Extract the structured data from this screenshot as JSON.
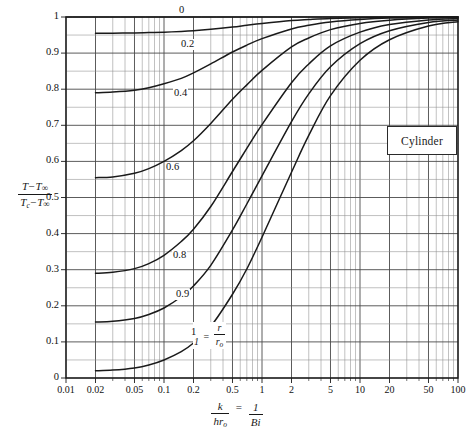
{
  "chart_data": {
    "type": "line",
    "title": "",
    "annotation_box": "Cylinder",
    "xlabel": "k/(hr_o) = 1/Bi",
    "ylabel": "(T - T∞)/(T_c - T∞)",
    "xscale": "log",
    "xlim": [
      0.01,
      100
    ],
    "ylim": [
      0,
      1
    ],
    "grid": true,
    "legend_position": "inline-curve-labels",
    "xticks": [
      "0.01",
      "0.02",
      "0.05",
      "0.1",
      "0.2",
      "0.5",
      "1",
      "2",
      "5",
      "10",
      "20",
      "50",
      "100"
    ],
    "xtick_values": [
      0.01,
      0.02,
      0.05,
      0.1,
      0.2,
      0.5,
      1,
      2,
      5,
      10,
      20,
      50,
      100
    ],
    "yticks": [
      "0",
      "0.1",
      "0.2",
      "0.3",
      "0.4",
      "0.5",
      "0.6",
      "0.7",
      "0.8",
      "0.9",
      "1"
    ],
    "ytick_values": [
      0,
      0.1,
      0.2,
      0.3,
      0.4,
      0.5,
      0.6,
      0.7,
      0.8,
      0.9,
      1
    ],
    "curve_parameter": "r/r_o",
    "series": [
      {
        "name": "0",
        "label": "0",
        "label_pos": {
          "x": 178,
          "y": 5
        },
        "x": [
          0.01,
          100
        ],
        "values": [
          1,
          1
        ]
      },
      {
        "name": "0.2",
        "label": "0.2",
        "label_pos": {
          "x": 180,
          "y": 39
        },
        "x": [
          0.02,
          0.03,
          0.05,
          0.07,
          0.1,
          0.15,
          0.2,
          0.3,
          0.5,
          0.7,
          1,
          2,
          3,
          5,
          10,
          20,
          50,
          100
        ],
        "values": [
          0.955,
          0.955,
          0.956,
          0.957,
          0.958,
          0.96,
          0.962,
          0.966,
          0.972,
          0.977,
          0.982,
          0.99,
          0.993,
          0.996,
          0.998,
          0.999,
          1.0,
          1.0
        ]
      },
      {
        "name": "0.4",
        "label": "0.4",
        "label_pos": {
          "x": 173,
          "y": 88
        },
        "x": [
          0.02,
          0.03,
          0.05,
          0.07,
          0.1,
          0.15,
          0.2,
          0.3,
          0.5,
          0.7,
          1,
          2,
          3,
          5,
          10,
          20,
          50,
          100
        ],
        "values": [
          0.79,
          0.792,
          0.797,
          0.804,
          0.815,
          0.83,
          0.845,
          0.87,
          0.903,
          0.922,
          0.94,
          0.967,
          0.977,
          0.986,
          0.993,
          0.997,
          0.999,
          1.0
        ]
      },
      {
        "name": "0.6",
        "label": "0.6",
        "label_pos": {
          "x": 165,
          "y": 162
        },
        "x": [
          0.02,
          0.03,
          0.05,
          0.07,
          0.1,
          0.15,
          0.2,
          0.3,
          0.5,
          0.7,
          1,
          2,
          3,
          5,
          10,
          20,
          50,
          100
        ],
        "values": [
          0.555,
          0.557,
          0.567,
          0.58,
          0.6,
          0.63,
          0.657,
          0.705,
          0.772,
          0.812,
          0.852,
          0.917,
          0.942,
          0.965,
          0.982,
          0.991,
          0.997,
          0.999
        ]
      },
      {
        "name": "0.8",
        "label": "0.8",
        "label_pos": {
          "x": 172,
          "y": 250
        },
        "x": [
          0.02,
          0.03,
          0.05,
          0.07,
          0.1,
          0.15,
          0.2,
          0.3,
          0.5,
          0.7,
          1,
          2,
          3,
          5,
          10,
          20,
          50,
          100
        ],
        "values": [
          0.29,
          0.293,
          0.303,
          0.317,
          0.34,
          0.378,
          0.412,
          0.475,
          0.572,
          0.636,
          0.702,
          0.818,
          0.87,
          0.92,
          0.958,
          0.979,
          0.992,
          0.996
        ]
      },
      {
        "name": "0.9",
        "label": "0.9",
        "label_pos": {
          "x": 175,
          "y": 289
        },
        "x": [
          0.02,
          0.03,
          0.05,
          0.07,
          0.1,
          0.15,
          0.2,
          0.3,
          0.5,
          0.7,
          1,
          2,
          3,
          5,
          10,
          20,
          50,
          100
        ],
        "values": [
          0.155,
          0.157,
          0.165,
          0.176,
          0.194,
          0.225,
          0.255,
          0.312,
          0.41,
          0.482,
          0.56,
          0.71,
          0.787,
          0.862,
          0.926,
          0.962,
          0.985,
          0.992
        ]
      },
      {
        "name": "1",
        "label": "1",
        "label_pos": {
          "x": 190,
          "y": 327
        },
        "x": [
          0.02,
          0.03,
          0.05,
          0.07,
          0.1,
          0.15,
          0.2,
          0.3,
          0.5,
          0.7,
          1,
          2,
          3,
          5,
          10,
          20,
          50,
          100
        ],
        "values": [
          0.02,
          0.022,
          0.028,
          0.036,
          0.05,
          0.073,
          0.097,
          0.143,
          0.232,
          0.302,
          0.39,
          0.57,
          0.672,
          0.782,
          0.88,
          0.937,
          0.975,
          0.987
        ]
      }
    ]
  },
  "axis": {
    "y_numerator_first": "T",
    "y_numerator_second": "T",
    "y_numerator_sub": "∞",
    "y_denominator_first": "T",
    "y_denominator_first_sub": "c",
    "y_denominator_second": "T",
    "y_denominator_sub": "∞",
    "minus": "−",
    "x_frac_num": "k",
    "x_frac_den": "hr",
    "x_frac_den_sub": "o",
    "x_equals": "=",
    "x_frac2_num": "1",
    "x_frac2_den": "Bi"
  },
  "annotations": {
    "cylinder_label": "Cylinder",
    "rro_one": "1",
    "rro_equals": "=",
    "rro_num": "r",
    "rro_den": "r",
    "rro_den_sub": "o"
  },
  "colors": {
    "curve": "#1a1a1a",
    "grid_major": "#4a4a4a",
    "grid_minor": "#8d8d8d",
    "frame": "#1a1a1a",
    "background": "#ffffff"
  }
}
